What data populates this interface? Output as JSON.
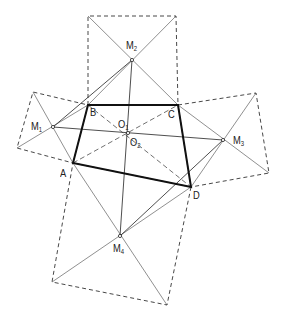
{
  "diagram": {
    "title": "",
    "points": {
      "A": {
        "label": "A",
        "x": 73,
        "y": 163
      },
      "B": {
        "label": "B",
        "x": 88,
        "y": 105
      },
      "C": {
        "label": "C",
        "x": 178,
        "y": 105
      },
      "D": {
        "label": "D",
        "x": 191,
        "y": 187
      },
      "M1": {
        "label": "M",
        "sub": "1",
        "x": 53,
        "y": 127
      },
      "M2": {
        "label": "M",
        "sub": "2",
        "x": 132,
        "y": 60
      },
      "M3": {
        "label": "M",
        "sub": "3",
        "x": 223,
        "y": 140
      },
      "M4": {
        "label": "M",
        "sub": "4",
        "x": 120,
        "y": 236
      },
      "O1": {
        "label": "O",
        "sub": "1",
        "x": 128,
        "y": 133
      },
      "O2": {
        "label": "O",
        "sub": "2",
        "x": 128,
        "y": 133
      }
    },
    "squares": [
      {
        "name": "square-on-AB",
        "vertices": [
          [
            73,
            163
          ],
          [
            88,
            105
          ],
          [
            33,
            92
          ],
          [
            17,
            148
          ]
        ]
      },
      {
        "name": "square-on-BC",
        "vertices": [
          [
            88,
            105
          ],
          [
            178,
            105
          ],
          [
            176,
            16
          ],
          [
            88,
            16
          ]
        ]
      },
      {
        "name": "square-on-CD",
        "vertices": [
          [
            178,
            105
          ],
          [
            256,
            93
          ],
          [
            269,
            173
          ],
          [
            191,
            187
          ]
        ]
      },
      {
        "name": "square-on-DA",
        "vertices": [
          [
            191,
            187
          ],
          [
            73,
            163
          ],
          [
            52,
            282
          ],
          [
            167,
            305
          ]
        ]
      }
    ],
    "quadrilateral": [
      "A",
      "B",
      "C",
      "D"
    ],
    "solid_lines": [
      [
        "M1",
        "M3"
      ],
      [
        "M2",
        "M4"
      ],
      [
        "M1",
        "M2"
      ],
      [
        "M3",
        "M4"
      ]
    ],
    "dashed_lines": [
      [
        "A",
        "C"
      ],
      [
        "B",
        "D"
      ]
    ]
  }
}
